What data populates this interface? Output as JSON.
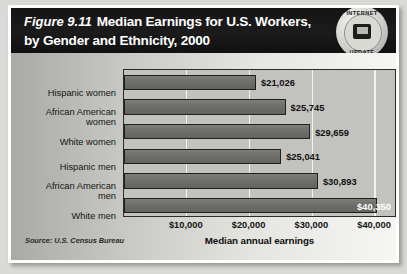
{
  "figure": {
    "number_label": "Figure 9.11",
    "title": "Median Earnings for U.S. Workers,",
    "title_line2": "by Gender and Ethnicity, 2000",
    "source_note": "Source: U.S. Census Bureau"
  },
  "badge": {
    "name": "internet-update-seal",
    "top_text": "INTERNET",
    "bottom_text": "UPDATE",
    "icon": "computer-monitor-icon"
  },
  "colors": {
    "header_band": "#151515",
    "bar_fill": "#6e6e6b",
    "bar_outline": "#1f1f1d",
    "plot_background": "#c2c2bf",
    "gridline": "#f4f4f2",
    "card_background": "#fdfdfb"
  },
  "chart_data": {
    "type": "bar",
    "orientation": "horizontal",
    "xlabel": "Median annual earnings",
    "ylabel": "",
    "xlim": [
      0,
      43500
    ],
    "grid": true,
    "legend": null,
    "source": "Source: U.S. Census Bureau",
    "xticks": [
      10000,
      20000,
      30000,
      40000
    ],
    "xtick_labels": [
      "$10,000",
      "$20,000",
      "$30,000",
      "$40,000"
    ],
    "categories": [
      "Hispanic women",
      "African American women",
      "White women",
      "Hispanic men",
      "African American men",
      "White men"
    ],
    "values": [
      21026,
      25745,
      29659,
      25041,
      30893,
      40350
    ],
    "value_labels": [
      "$21,026",
      "$25,745",
      "$29,659",
      "$25,041",
      "$30,893",
      "$40,350"
    ],
    "label_placement": [
      "outside",
      "outside",
      "outside",
      "outside",
      "outside",
      "inside"
    ]
  }
}
